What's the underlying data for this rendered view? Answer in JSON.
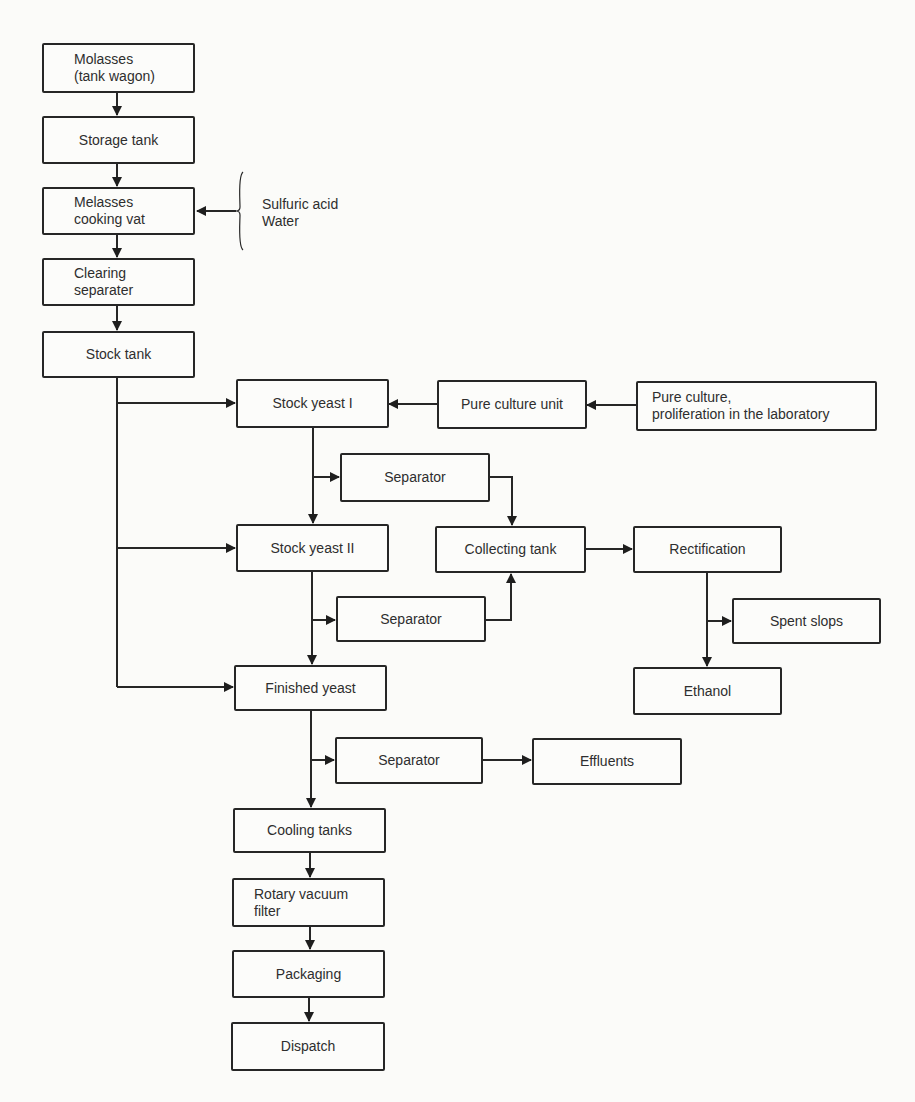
{
  "diagram": {
    "type": "process-flowchart",
    "nodes": {
      "molasses": {
        "label": "Molasses\n(tank wagon)"
      },
      "storage_tank": {
        "label": "Storage tank"
      },
      "cooking_vat": {
        "label": "Melasses\ncooking vat"
      },
      "clearing_separater": {
        "label": "Clearing\nseparater"
      },
      "stock_tank": {
        "label": "Stock tank"
      },
      "stock_yeast_1": {
        "label": "Stock yeast I"
      },
      "pure_culture_unit": {
        "label": "Pure culture unit"
      },
      "pure_culture_lab": {
        "label": "Pure culture,\nproliferation in the laboratory"
      },
      "separator_1": {
        "label": "Separator"
      },
      "stock_yeast_2": {
        "label": "Stock yeast II"
      },
      "collecting_tank": {
        "label": "Collecting tank"
      },
      "rectification": {
        "label": "Rectification"
      },
      "separator_2": {
        "label": "Separator"
      },
      "spent_slops": {
        "label": "Spent slops"
      },
      "finished_yeast": {
        "label": "Finished yeast"
      },
      "ethanol": {
        "label": "Ethanol"
      },
      "separator_3": {
        "label": "Separator"
      },
      "effluents": {
        "label": "Effluents"
      },
      "cooling_tanks": {
        "label": "Cooling tanks"
      },
      "rotary_vacuum_filter": {
        "label": "Rotary vacuum\nfilter"
      },
      "packaging": {
        "label": "Packaging"
      },
      "dispatch": {
        "label": "Dispatch"
      }
    },
    "inputs": {
      "cooking_vat_inputs": {
        "label": "Sulfuric acid\nWater"
      }
    },
    "edges": [
      [
        "molasses",
        "storage_tank"
      ],
      [
        "storage_tank",
        "cooking_vat"
      ],
      [
        "cooking_vat_inputs",
        "cooking_vat"
      ],
      [
        "cooking_vat",
        "clearing_separater"
      ],
      [
        "clearing_separater",
        "stock_tank"
      ],
      [
        "stock_tank",
        "stock_yeast_1"
      ],
      [
        "stock_tank",
        "stock_yeast_2"
      ],
      [
        "stock_tank",
        "finished_yeast"
      ],
      [
        "pure_culture_lab",
        "pure_culture_unit"
      ],
      [
        "pure_culture_unit",
        "stock_yeast_1"
      ],
      [
        "stock_yeast_1",
        "separator_1"
      ],
      [
        "stock_yeast_1",
        "stock_yeast_2"
      ],
      [
        "separator_1",
        "collecting_tank"
      ],
      [
        "stock_yeast_2",
        "separator_2"
      ],
      [
        "stock_yeast_2",
        "finished_yeast"
      ],
      [
        "separator_2",
        "collecting_tank"
      ],
      [
        "collecting_tank",
        "rectification"
      ],
      [
        "rectification",
        "spent_slops"
      ],
      [
        "rectification",
        "ethanol"
      ],
      [
        "finished_yeast",
        "separator_3"
      ],
      [
        "finished_yeast",
        "cooling_tanks"
      ],
      [
        "separator_3",
        "effluents"
      ],
      [
        "cooling_tanks",
        "rotary_vacuum_filter"
      ],
      [
        "rotary_vacuum_filter",
        "packaging"
      ],
      [
        "packaging",
        "dispatch"
      ]
    ]
  }
}
